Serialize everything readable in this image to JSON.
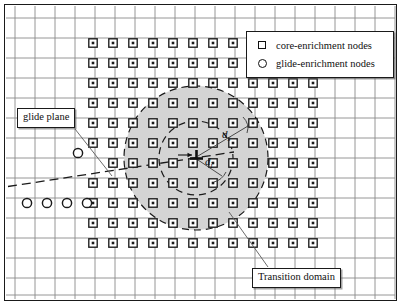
{
  "figure": {
    "domain": "finite-element mesh with dislocation enrichment zones",
    "width": 402,
    "height": 306,
    "background": "#ffffff",
    "frame_color": "#1a1a1a"
  },
  "legend": {
    "items": [
      {
        "symbol": "square",
        "icon_name": "square-node-icon",
        "label": "core-enrichment nodes"
      },
      {
        "symbol": "circle",
        "icon_name": "circle-node-icon",
        "label": "glide-enrichment nodes"
      }
    ]
  },
  "callouts": {
    "glide_plane": "glide plane",
    "transition_domain": "Transition domain"
  },
  "math_labels": {
    "outer_radius": {
      "base": "d",
      "subscript": "s"
    },
    "inner_radius": {
      "base": "d",
      "subscript": "i"
    }
  },
  "colors": {
    "mesh_line": "#8a8a8a",
    "node_stroke": "#1a1a1a",
    "node_fill": "#ffffff",
    "shaded_domain": "#d4d4d4",
    "dashed_circle": "#1a1a1a",
    "glide_plane_line": "#1a1a1a",
    "leader_line": "#555555"
  },
  "chart_data": {
    "type": "scatter",
    "title": "",
    "xlabel": "",
    "ylabel": "",
    "mesh": {
      "grid": true,
      "vertical_lines_x": [
        15,
        35,
        55,
        75,
        95,
        115,
        135,
        155,
        175,
        195,
        215,
        235,
        255,
        275,
        295,
        315,
        335,
        355,
        375,
        395
      ],
      "horizontal_lines_y": [
        18,
        38,
        58,
        78,
        98,
        118,
        138,
        158,
        178,
        198,
        218,
        238,
        258,
        278,
        295
      ],
      "spacing": 20
    },
    "core_enrichment_nodes": {
      "marker": "square",
      "rows": [
        {
          "y": 43,
          "x": [
            93,
            113,
            133,
            153,
            173,
            193,
            213,
            233
          ]
        },
        {
          "y": 63,
          "x": [
            93,
            113,
            133,
            153,
            173,
            193,
            213,
            233,
            253,
            273,
            293,
            313
          ]
        },
        {
          "y": 83,
          "x": [
            93,
            113,
            133,
            153,
            173,
            193,
            213,
            233,
            253,
            273,
            293,
            313
          ]
        },
        {
          "y": 103,
          "x": [
            93,
            113,
            133,
            153,
            173,
            193,
            213,
            233,
            253,
            273,
            293,
            313
          ]
        },
        {
          "y": 123,
          "x": [
            93,
            113,
            133,
            153,
            173,
            193,
            213,
            233,
            253,
            273,
            293,
            313
          ]
        },
        {
          "y": 143,
          "x": [
            93,
            113,
            133,
            153,
            173,
            193,
            213,
            233,
            253,
            273,
            293,
            313
          ]
        },
        {
          "y": 163,
          "x": [
            113,
            133,
            153,
            173,
            193,
            213,
            233,
            253,
            273,
            293,
            313
          ]
        },
        {
          "y": 183,
          "x": [
            93,
            113,
            133,
            153,
            173,
            193,
            213,
            233,
            253,
            273,
            293,
            313
          ]
        },
        {
          "y": 203,
          "x": [
            93,
            113,
            133,
            153,
            173,
            193,
            213,
            233,
            253,
            273,
            293,
            313
          ]
        },
        {
          "y": 223,
          "x": [
            93,
            113,
            133,
            153,
            173,
            193,
            213,
            233,
            253,
            273,
            293,
            313
          ]
        },
        {
          "y": 243,
          "x": [
            93,
            113,
            133,
            153,
            173,
            193,
            213,
            233,
            253,
            273,
            293,
            313
          ]
        }
      ]
    },
    "glide_enrichment_nodes": {
      "marker": "circle",
      "points": [
        {
          "x": 78,
          "y": 153
        },
        {
          "x": 27,
          "y": 203
        },
        {
          "x": 47,
          "y": 203
        },
        {
          "x": 67,
          "y": 203
        },
        {
          "x": 87,
          "y": 203
        }
      ]
    },
    "dislocation": {
      "x": 196,
      "y": 158,
      "symbol": "perpendicular"
    },
    "circles": [
      {
        "name": "outer_radius_circle",
        "cx": 196,
        "cy": 158,
        "r": 72,
        "style": "dashed",
        "label": "d_s"
      },
      {
        "name": "inner_radius_circle",
        "cx": 196,
        "cy": 158,
        "r": 37,
        "style": "dashed",
        "label": "d_i"
      }
    ],
    "shaded_region": {
      "name": "transition_domain",
      "cx": 196,
      "cy": 158,
      "r": 72,
      "fill": "#d4d4d4"
    },
    "glide_plane": {
      "style": "dashed",
      "x1": 8,
      "y1": 186,
      "x2": 232,
      "y2": 152
    }
  }
}
